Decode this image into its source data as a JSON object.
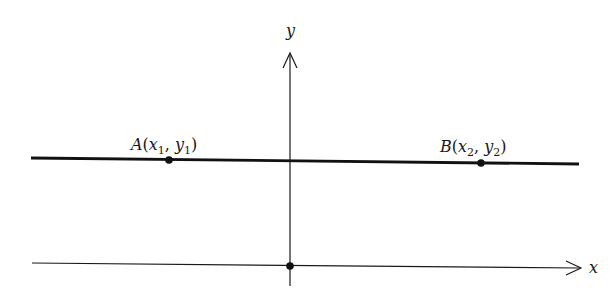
{
  "diagram": {
    "type": "coordinate-plane",
    "axes": {
      "x_label": "x",
      "y_label": "y"
    },
    "points": [
      {
        "id": "A",
        "name": "A",
        "label": "A(x1, y1)",
        "x_sub": "1",
        "y_sub": "1"
      },
      {
        "id": "B",
        "name": "B",
        "label": "B(x2, y2)",
        "x_sub": "2",
        "y_sub": "2"
      },
      {
        "id": "O",
        "name": "origin",
        "label": ""
      }
    ],
    "line": {
      "description": "horizontal line through A and B"
    },
    "colors": {
      "ink": "#1a1a1a",
      "background": "#ffffff"
    }
  }
}
